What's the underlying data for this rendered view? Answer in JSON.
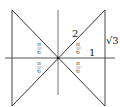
{
  "diagram": {
    "labels": {
      "hypotenuse": "2",
      "adjacent": "1",
      "opposite": "√3",
      "angle_num": "π",
      "angle_den": "6"
    },
    "colors": {
      "line": "#333333",
      "axis": "#555555",
      "background": "#ffffff"
    }
  }
}
